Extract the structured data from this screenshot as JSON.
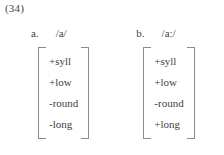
{
  "example": {
    "number": "(34)"
  },
  "items": [
    {
      "letter": "a.",
      "ipa": "/a/",
      "features": [
        "+syll",
        "+low",
        "-round",
        "-long"
      ]
    },
    {
      "letter": "b.",
      "ipa": "/aː/",
      "features": [
        "+syll",
        "+low",
        "-round",
        "+long"
      ]
    }
  ],
  "colors": {
    "text": "#3f3f3f",
    "bracket": "#8a8a8a",
    "background": "#ffffff"
  }
}
